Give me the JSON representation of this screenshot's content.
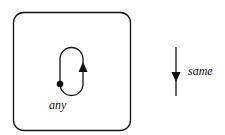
{
  "diagram": {
    "box": {
      "label": "any",
      "contents": "loop-with-start-dot-and-up-arrow"
    },
    "right_arrow": {
      "direction": "down",
      "label": "same"
    },
    "colors": {
      "stroke": "#111111",
      "background": "#ffffff"
    }
  }
}
